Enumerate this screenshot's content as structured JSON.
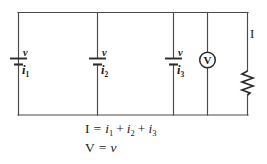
{
  "figure": {
    "type": "electrical-schematic",
    "branch_current_label": "I",
    "cells": [
      {
        "voltage_label": "v",
        "current_label": "i",
        "current_subscript": "1"
      },
      {
        "voltage_label": "v",
        "current_label": "i",
        "current_subscript": "2"
      },
      {
        "voltage_label": "v",
        "current_label": "i",
        "current_subscript": "3"
      }
    ],
    "meter": {
      "symbol": "V",
      "name": "voltmeter"
    },
    "resistor": {
      "name": "resistor",
      "label": ""
    },
    "equations": {
      "current": {
        "lhs": "I",
        "eq": "=",
        "term1": "i",
        "term1_sub": "1",
        "plus1": "+",
        "term2": "i",
        "term2_sub": "2",
        "plus2": "+",
        "term3": "i",
        "term3_sub": "3"
      },
      "voltage": {
        "lhs": "V",
        "eq": "=",
        "rhs": "v"
      }
    },
    "colors": {
      "wire": "#4a4a4a",
      "symbol": "#2b2b2b",
      "text": "#1a1a1a",
      "background": "#ffffff"
    }
  }
}
